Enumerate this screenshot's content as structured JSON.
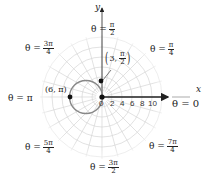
{
  "diagram": {
    "type": "polar-graph",
    "origin_px": [
      102,
      97
    ],
    "px_per_unit": 5,
    "grid": {
      "rings_max": 12,
      "radial_step_deg": 15,
      "color": "#d8d8d8"
    },
    "axes": {
      "x_label": "x",
      "y_label": "y",
      "x_ticks": [
        "0",
        "2",
        "4",
        "6",
        "8",
        "10"
      ]
    },
    "curve": {
      "kind": "circle",
      "description": "r = -6cos θ + 3sin θ style circle through origin",
      "color": "#777777"
    },
    "points": [
      {
        "label_pre": "(3, ",
        "label_num": "π",
        "label_den": "2",
        "label_post": ")",
        "id": "pt-3-pi-2"
      },
      {
        "label": "(6, π)",
        "id": "pt-6-pi"
      },
      {
        "label": "",
        "id": "pt-origin"
      }
    ],
    "angle_labels": {
      "pi_over_2": {
        "lhs": "θ =",
        "num": "π",
        "den": "2"
      },
      "three_pi_over_4": {
        "lhs": "θ =",
        "num": "3π",
        "den": "4"
      },
      "pi_over_4": {
        "lhs": "θ =",
        "num": "π",
        "den": "4"
      },
      "pi": {
        "lhs": "θ = π"
      },
      "zero": {
        "lhs": "θ = 0"
      },
      "five_pi_over_4": {
        "lhs": "θ =",
        "num": "5π",
        "den": "4"
      },
      "seven_pi_over_4": {
        "lhs": "θ =",
        "num": "7π",
        "den": "4"
      },
      "three_pi_over_2": {
        "lhs": "θ =",
        "num": "3π",
        "den": "2"
      }
    }
  }
}
